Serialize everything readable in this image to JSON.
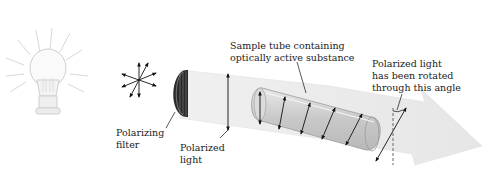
{
  "diagram": {
    "labels": {
      "polarizing_filter": [
        "Polarizing",
        "filter"
      ],
      "polarized_light": [
        "Polarized",
        "light"
      ],
      "sample_tube": [
        "Sample tube containing",
        "optically active substance"
      ],
      "rotated_light": [
        "Polarized light",
        "has been rotated",
        "through this angle"
      ]
    },
    "components": [
      {
        "name": "light-source",
        "icon": "light-bulb-icon"
      },
      {
        "name": "unpolarized-light",
        "icon": "multidirectional-arrows-icon"
      },
      {
        "name": "polarizing-filter",
        "icon": "disc-filter-icon"
      },
      {
        "name": "polarized-light-beam",
        "icon": "vertical-double-arrow-icon"
      },
      {
        "name": "sample-tube",
        "icon": "glass-tube-icon"
      },
      {
        "name": "rotated-light-arrow",
        "icon": "big-arrow-icon"
      },
      {
        "name": "rotation-angle-marker",
        "icon": "dashed-reference-line-icon"
      }
    ],
    "colors": {
      "beam": "#ececec",
      "tube": "#d4d4d4",
      "tube_edge": "#9a9a9a",
      "arrows": "#111111",
      "text": "#222222"
    }
  }
}
